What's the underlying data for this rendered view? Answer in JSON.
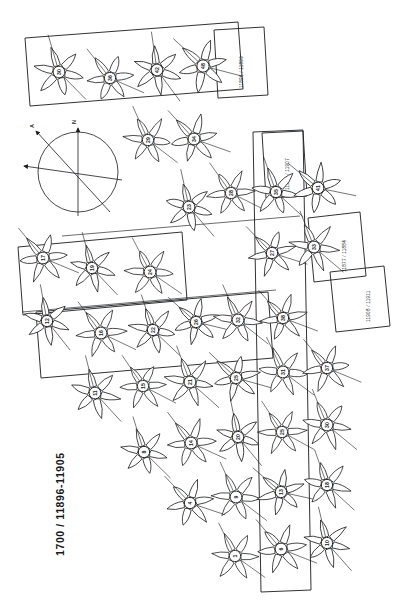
{
  "sheet": {
    "main_caption": "1700 / 11896-11905",
    "background_color": "#ffffff",
    "ink_color": "#1b1c1e",
    "sheet_rotation_note": "plan rotated 90 degrees"
  },
  "compass": {
    "name": "north-arrow-compass-rose",
    "labels": {
      "north": "N",
      "secondary": "A"
    },
    "center": {
      "x": 78,
      "y": 172
    },
    "radius": 40
  },
  "label_boxes": [
    {
      "id": "box-top-left",
      "text": "11896 / 11899"
    },
    {
      "id": "box-right-upper",
      "text": "11900 / 11907"
    },
    {
      "id": "box-right-mid",
      "text": "11877 / 11884"
    },
    {
      "id": "box-right-low",
      "text": "11908 / 11911"
    }
  ],
  "frames": [
    {
      "id": "frame-top-rosette-band",
      "kind": "rotated-rectangle"
    },
    {
      "id": "frame-left-band",
      "kind": "rotated-rectangle"
    },
    {
      "id": "frame-mid-band",
      "kind": "rotated-rectangle"
    },
    {
      "id": "frame-tall-vertical",
      "kind": "tall-narrow-rectangle"
    }
  ],
  "rosettes": [
    {
      "id": "r01",
      "label": "30",
      "x": 59,
      "y": 72,
      "r": 25,
      "petals": 6,
      "rot": 14
    },
    {
      "id": "r02",
      "label": "36",
      "x": 110,
      "y": 78,
      "r": 24,
      "petals": 6,
      "rot": -8
    },
    {
      "id": "r03",
      "label": "42",
      "x": 157,
      "y": 70,
      "r": 25,
      "petals": 6,
      "rot": 22
    },
    {
      "id": "r04",
      "label": "48",
      "x": 203,
      "y": 66,
      "r": 26,
      "petals": 6,
      "rot": -17
    },
    {
      "id": "r05",
      "label": "29",
      "x": 148,
      "y": 140,
      "r": 24,
      "petals": 6,
      "rot": 6
    },
    {
      "id": "r06",
      "label": "34",
      "x": 194,
      "y": 139,
      "r": 25,
      "petals": 6,
      "rot": -12
    },
    {
      "id": "r07",
      "label": "23",
      "x": 189,
      "y": 207,
      "r": 25,
      "petals": 6,
      "rot": 18
    },
    {
      "id": "r08",
      "label": "28",
      "x": 231,
      "y": 193,
      "r": 24,
      "petals": 6,
      "rot": -5
    },
    {
      "id": "r09",
      "label": "35",
      "x": 276,
      "y": 192,
      "r": 24,
      "petals": 6,
      "rot": 11
    },
    {
      "id": "r10",
      "label": "41",
      "x": 318,
      "y": 188,
      "r": 25,
      "petals": 6,
      "rot": -20
    },
    {
      "id": "r11",
      "label": "17",
      "x": 43,
      "y": 258,
      "r": 25,
      "petals": 6,
      "rot": -9
    },
    {
      "id": "r12",
      "label": "19",
      "x": 92,
      "y": 268,
      "r": 24,
      "petals": 6,
      "rot": 15
    },
    {
      "id": "r13",
      "label": "24",
      "x": 150,
      "y": 272,
      "r": 25,
      "petals": 6,
      "rot": 3
    },
    {
      "id": "r14",
      "label": "27",
      "x": 272,
      "y": 253,
      "r": 24,
      "petals": 6,
      "rot": -14
    },
    {
      "id": "r15",
      "label": "33",
      "x": 314,
      "y": 247,
      "r": 25,
      "petals": 6,
      "rot": 9
    },
    {
      "id": "r16",
      "label": "12",
      "x": 47,
      "y": 321,
      "r": 24,
      "petals": 6,
      "rot": 20
    },
    {
      "id": "r17",
      "label": "16",
      "x": 101,
      "y": 333,
      "r": 25,
      "petals": 6,
      "rot": -6
    },
    {
      "id": "r18",
      "label": "22",
      "x": 153,
      "y": 330,
      "r": 24,
      "petals": 6,
      "rot": 12
    },
    {
      "id": "r19",
      "label": "26",
      "x": 196,
      "y": 322,
      "r": 24,
      "petals": 6,
      "rot": -18
    },
    {
      "id": "r20",
      "label": "32",
      "x": 238,
      "y": 320,
      "r": 25,
      "petals": 6,
      "rot": 7
    },
    {
      "id": "r21",
      "label": "38",
      "x": 283,
      "y": 318,
      "r": 24,
      "petals": 6,
      "rot": -11
    },
    {
      "id": "r22",
      "label": "11",
      "x": 95,
      "y": 393,
      "r": 25,
      "petals": 6,
      "rot": 16
    },
    {
      "id": "r23",
      "label": "15",
      "x": 143,
      "y": 386,
      "r": 24,
      "petals": 6,
      "rot": -4
    },
    {
      "id": "r24",
      "label": "21",
      "x": 190,
      "y": 382,
      "r": 25,
      "petals": 6,
      "rot": 10
    },
    {
      "id": "r25",
      "label": "25",
      "x": 236,
      "y": 378,
      "r": 24,
      "petals": 6,
      "rot": -16
    },
    {
      "id": "r26",
      "label": "31",
      "x": 283,
      "y": 372,
      "r": 25,
      "petals": 6,
      "rot": 5
    },
    {
      "id": "r27",
      "label": "37",
      "x": 327,
      "y": 368,
      "r": 24,
      "petals": 6,
      "rot": -9
    },
    {
      "id": "r28",
      "label": "8",
      "x": 144,
      "y": 452,
      "r": 24,
      "petals": 6,
      "rot": 13
    },
    {
      "id": "r29",
      "label": "14",
      "x": 191,
      "y": 443,
      "r": 25,
      "petals": 6,
      "rot": -7
    },
    {
      "id": "r30",
      "label": "20",
      "x": 238,
      "y": 437,
      "r": 24,
      "petals": 6,
      "rot": 19
    },
    {
      "id": "r31",
      "label": "25",
      "x": 282,
      "y": 432,
      "r": 24,
      "petals": 6,
      "rot": -3
    },
    {
      "id": "r32",
      "label": "30",
      "x": 327,
      "y": 425,
      "r": 25,
      "petals": 6,
      "rot": 8
    },
    {
      "id": "r33",
      "label": "4",
      "x": 190,
      "y": 503,
      "r": 24,
      "petals": 6,
      "rot": -13
    },
    {
      "id": "r34",
      "label": "9",
      "x": 236,
      "y": 497,
      "r": 25,
      "petals": 6,
      "rot": 6
    },
    {
      "id": "r35",
      "label": "13",
      "x": 281,
      "y": 492,
      "r": 24,
      "petals": 6,
      "rot": -19
    },
    {
      "id": "r36",
      "label": "18",
      "x": 327,
      "y": 485,
      "r": 24,
      "petals": 6,
      "rot": 11
    },
    {
      "id": "r37",
      "label": "1",
      "x": 235,
      "y": 556,
      "r": 24,
      "petals": 6,
      "rot": 4
    },
    {
      "id": "r38",
      "label": "6",
      "x": 281,
      "y": 549,
      "r": 25,
      "petals": 6,
      "rot": -10
    },
    {
      "id": "r39",
      "label": "10",
      "x": 327,
      "y": 543,
      "r": 24,
      "petals": 6,
      "rot": 17
    }
  ]
}
